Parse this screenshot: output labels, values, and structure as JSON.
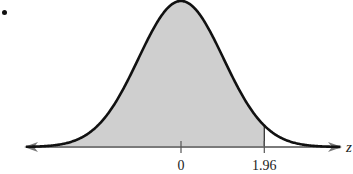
{
  "chart_data": {
    "type": "area",
    "title": "",
    "xlabel": "z",
    "ylabel": "",
    "distribution": "standard normal",
    "mean": 0,
    "std": 1,
    "shaded_region": {
      "from": "-inf",
      "to": 1.96
    },
    "ticks": [
      {
        "value": 0,
        "label": "0"
      },
      {
        "value": 1.96,
        "label": "1.96"
      }
    ],
    "xlim": [
      -3.7,
      3.85
    ],
    "grid": false,
    "legend": null,
    "colors": {
      "curve": "#111111",
      "fill": "#cfcfcf",
      "axis": "#7a7a7a"
    }
  },
  "labels": {
    "axis": "z",
    "bullet": "•"
  }
}
